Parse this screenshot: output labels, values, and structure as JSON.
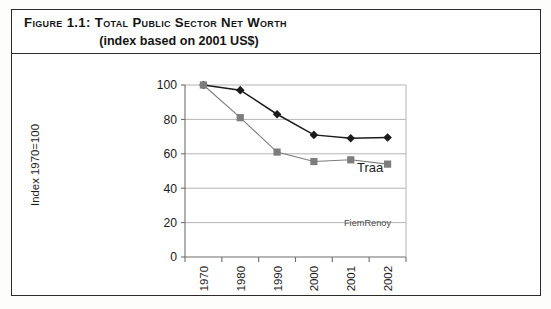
{
  "figure": {
    "caption_line1": "Figure 1.1: Total Public Sector Net Worth",
    "caption_line2": "(index based on 2001 US$)"
  },
  "chart_data": {
    "type": "line",
    "title": "Total Public Sector Net Worth (index based on 2001 US$)",
    "xlabel": "",
    "ylabel": "Index 1970=100",
    "categories": [
      "1970",
      "1980",
      "1990",
      "2000",
      "2001",
      "2002"
    ],
    "ylim": [
      0,
      100
    ],
    "yticks": [
      0,
      20,
      40,
      60,
      80,
      100
    ],
    "ytick_labels": [
      "0",
      "20",
      "40",
      "60",
      "80",
      "100"
    ],
    "grid": "horizontal",
    "legend_position": "inline-annotation",
    "series": [
      {
        "name": "Traa",
        "marker": "diamond",
        "color": "#1c1c1c",
        "values": [
          100,
          97,
          83,
          71,
          69,
          69.5
        ],
        "label_text": "Traa"
      },
      {
        "name": "FiemRenoy",
        "marker": "square",
        "color": "#7d7d7d",
        "values": [
          100,
          81,
          61,
          55.5,
          56.5,
          54
        ],
        "label_text": "FiemRenoy"
      }
    ]
  },
  "colors": {
    "frame": "#2b2b2b",
    "series_a": "#1c1c1c",
    "series_b": "#7d7d7d",
    "gridline": "#b4b4b4",
    "axis": "#6e6e6e",
    "text": "#141414",
    "background": "#ffffff"
  }
}
